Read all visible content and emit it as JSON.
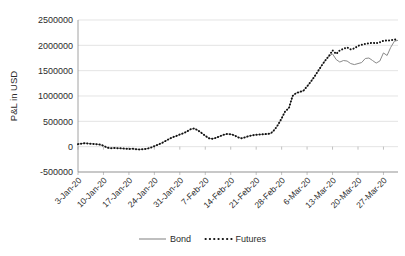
{
  "chart_data": {
    "type": "line",
    "title": "",
    "xlabel": "",
    "ylabel": "P&L in USD",
    "ylim": [
      -500000,
      2500000
    ],
    "ytick_values": [
      2500000,
      2000000,
      1500000,
      1000000,
      500000,
      0,
      -500000
    ],
    "ytick_labels": [
      "2500000",
      "2000000",
      "1500000",
      "1000000",
      "500000",
      "0",
      "-500000"
    ],
    "grid": true,
    "legend_position": "bottom",
    "xtick_labels": [
      "3-Jan-20",
      "10-Jan-20",
      "17-Jan-20",
      "24-Jan-20",
      "31-Jan-20",
      "7-Feb-20",
      "14-Feb-20",
      "21-Feb-20",
      "28-Feb-20",
      "6-Mar-20",
      "13-Mar-20",
      "20-Mar-20",
      "27-Mar-20"
    ],
    "xtick_indices": [
      0,
      7,
      14,
      21,
      28,
      35,
      42,
      49,
      56,
      63,
      70,
      77,
      84
    ],
    "x": [
      "3-Jan-20",
      "4-Jan-20",
      "5-Jan-20",
      "6-Jan-20",
      "7-Jan-20",
      "8-Jan-20",
      "9-Jan-20",
      "10-Jan-20",
      "11-Jan-20",
      "12-Jan-20",
      "13-Jan-20",
      "14-Jan-20",
      "15-Jan-20",
      "16-Jan-20",
      "17-Jan-20",
      "18-Jan-20",
      "19-Jan-20",
      "20-Jan-20",
      "21-Jan-20",
      "22-Jan-20",
      "23-Jan-20",
      "24-Jan-20",
      "25-Jan-20",
      "26-Jan-20",
      "27-Jan-20",
      "28-Jan-20",
      "29-Jan-20",
      "30-Jan-20",
      "31-Jan-20",
      "1-Feb-20",
      "2-Feb-20",
      "3-Feb-20",
      "4-Feb-20",
      "5-Feb-20",
      "6-Feb-20",
      "7-Feb-20",
      "8-Feb-20",
      "9-Feb-20",
      "10-Feb-20",
      "11-Feb-20",
      "12-Feb-20",
      "13-Feb-20",
      "14-Feb-20",
      "15-Feb-20",
      "16-Feb-20",
      "17-Feb-20",
      "18-Feb-20",
      "19-Feb-20",
      "20-Feb-20",
      "21-Feb-20",
      "22-Feb-20",
      "23-Feb-20",
      "24-Feb-20",
      "25-Feb-20",
      "26-Feb-20",
      "27-Feb-20",
      "28-Feb-20",
      "29-Feb-20",
      "1-Mar-20",
      "2-Mar-20",
      "3-Mar-20",
      "4-Mar-20",
      "5-Mar-20",
      "6-Mar-20",
      "7-Mar-20",
      "8-Mar-20",
      "9-Mar-20",
      "10-Mar-20",
      "11-Mar-20",
      "12-Mar-20",
      "13-Mar-20",
      "14-Mar-20",
      "15-Mar-20",
      "16-Mar-20",
      "17-Mar-20",
      "18-Mar-20",
      "19-Mar-20",
      "20-Mar-20",
      "21-Mar-20",
      "22-Mar-20",
      "23-Mar-20",
      "24-Mar-20",
      "25-Mar-20",
      "26-Mar-20",
      "27-Mar-20",
      "28-Mar-20",
      "29-Mar-20",
      "30-Mar-20",
      "31-Mar-20"
    ],
    "series": [
      {
        "name": "Bond",
        "style": "solid",
        "color": "#8a8a8a",
        "values": [
          50000,
          60000,
          70000,
          60000,
          55000,
          50000,
          40000,
          20000,
          -20000,
          -30000,
          -25000,
          -30000,
          -35000,
          -40000,
          -45000,
          -40000,
          -50000,
          -55000,
          -50000,
          -40000,
          -20000,
          10000,
          40000,
          70000,
          110000,
          150000,
          185000,
          210000,
          240000,
          265000,
          300000,
          345000,
          360000,
          320000,
          270000,
          215000,
          165000,
          155000,
          175000,
          205000,
          235000,
          250000,
          245000,
          225000,
          185000,
          165000,
          185000,
          210000,
          225000,
          235000,
          240000,
          245000,
          250000,
          260000,
          330000,
          430000,
          560000,
          700000,
          760000,
          1000000,
          1060000,
          1080000,
          1105000,
          1190000,
          1280000,
          1380000,
          1490000,
          1600000,
          1700000,
          1790000,
          1830000,
          1720000,
          1670000,
          1700000,
          1690000,
          1640000,
          1620000,
          1640000,
          1660000,
          1740000,
          1750000,
          1700000,
          1650000,
          1690000,
          1850000,
          1800000,
          1960000,
          2080000,
          2100000
        ]
      },
      {
        "name": "Futures",
        "style": "dotted",
        "color": "#111111",
        "values": [
          50000,
          60000,
          70000,
          60000,
          55000,
          50000,
          40000,
          20000,
          -20000,
          -30000,
          -25000,
          -30000,
          -35000,
          -40000,
          -45000,
          -40000,
          -50000,
          -55000,
          -50000,
          -40000,
          -20000,
          10000,
          40000,
          70000,
          110000,
          150000,
          185000,
          210000,
          240000,
          265000,
          300000,
          345000,
          360000,
          320000,
          270000,
          215000,
          165000,
          155000,
          175000,
          205000,
          235000,
          250000,
          245000,
          225000,
          185000,
          165000,
          185000,
          210000,
          225000,
          235000,
          240000,
          245000,
          250000,
          260000,
          330000,
          430000,
          560000,
          700000,
          760000,
          1000000,
          1060000,
          1080000,
          1105000,
          1190000,
          1280000,
          1380000,
          1490000,
          1600000,
          1700000,
          1790000,
          1900000,
          1830000,
          1900000,
          1930000,
          1960000,
          1920000,
          1940000,
          1990000,
          2010000,
          2030000,
          2040000,
          2050000,
          2040000,
          2060000,
          2090000,
          2095000,
          2100000,
          2115000,
          2110000
        ]
      }
    ],
    "legend": [
      {
        "label": "Bond",
        "style": "solid",
        "color": "#8a8a8a"
      },
      {
        "label": "Futures",
        "style": "dotted",
        "color": "#111111"
      }
    ]
  }
}
